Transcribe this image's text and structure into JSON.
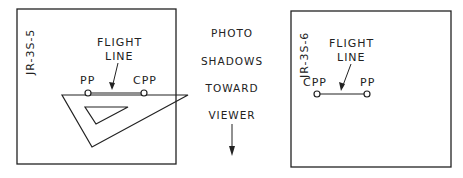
{
  "left_photo": {
    "id_label": "JR-3S-5",
    "flight_line_label_1": "FLIGHT",
    "flight_line_label_2": "LINE",
    "pp_label": "PP",
    "cpp_label": "CPP"
  },
  "center_text": {
    "lines": [
      "PHOTO",
      "SHADOWS",
      "TOWARD",
      "VIEWER"
    ]
  },
  "right_photo": {
    "id_label": "JR-3S-6",
    "flight_line_label_1": "FLIGHT",
    "flight_line_label_2": "LINE",
    "cpp_label": "CPP",
    "pp_label": "PP"
  },
  "colors": {
    "stroke": "#222222",
    "background": "#ffffff"
  }
}
